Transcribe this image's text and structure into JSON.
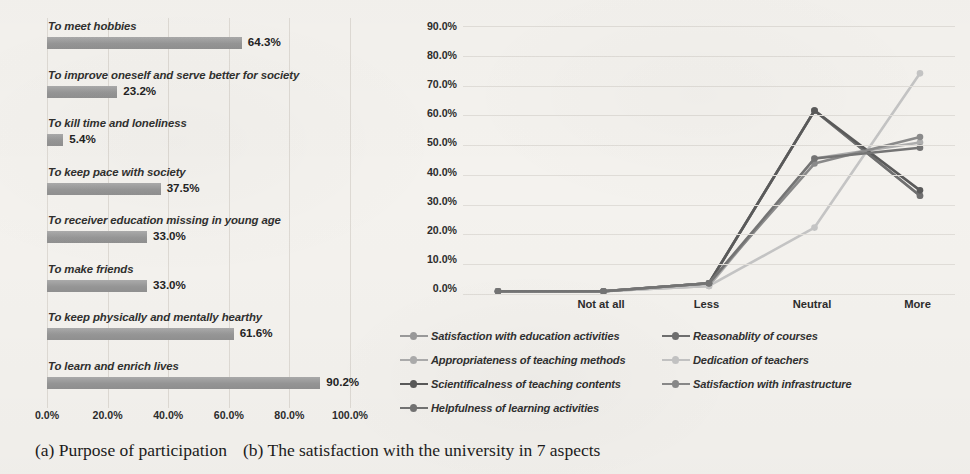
{
  "figure": {
    "captions": [
      {
        "tag": "(a)",
        "text": "Purpose of participation"
      },
      {
        "tag": "(b)",
        "text": "The satisfaction with the university in 7 aspects"
      }
    ]
  },
  "chart_data": [
    {
      "type": "bar",
      "orientation": "horizontal",
      "title": "",
      "xlabel": "",
      "ylabel": "",
      "xlim": [
        0,
        100
      ],
      "grid": true,
      "tick_labels": [
        "0.0%",
        "20.0%",
        "40.0%",
        "60.0%",
        "80.0%",
        "100.0%"
      ],
      "ticks": [
        0,
        20,
        40,
        60,
        80,
        100
      ],
      "bar_color": "#9a9a9a",
      "categories": [
        "To meet hobbies",
        "To improve oneself and serve better for society",
        "To kill time and loneliness",
        "To keep pace with  society",
        "To receiver education missing in young age",
        "To make friends",
        "To keep physically and mentally hearthy",
        "To learn and enrich lives"
      ],
      "values": [
        64.3,
        23.2,
        5.4,
        37.5,
        33.0,
        33.0,
        61.6,
        90.2
      ],
      "value_labels": [
        "64.3%",
        "23.2%",
        "5.4%",
        "37.5%",
        "33.0%",
        "33.0%",
        "61.6%",
        "90.2%"
      ]
    },
    {
      "type": "line",
      "title": "",
      "xlabel": "",
      "ylabel": "",
      "ylim": [
        0,
        90
      ],
      "grid": true,
      "legend_position": "bottom",
      "categories": [
        "Not at all",
        "Less",
        "Neutral",
        "More",
        "Very"
      ],
      "y_tick_labels": [
        "0.0%",
        "10.0%",
        "20.0%",
        "30.0%",
        "40.0%",
        "50.0%",
        "60.0%",
        "70.0%",
        "80.0%",
        "90.0%"
      ],
      "y_ticks": [
        0,
        10,
        20,
        30,
        40,
        50,
        60,
        70,
        80,
        90
      ],
      "series": [
        {
          "name": "Satisfaction with education activities",
          "color": "#9b9b9b",
          "values": [
            0.9,
            0.9,
            3.6,
            61.6,
            33.0
          ]
        },
        {
          "name": "Reasonablity of courses",
          "color": "#6f6f6f",
          "values": [
            0.9,
            0.9,
            3.6,
            61.6,
            33.0
          ]
        },
        {
          "name": "Appropriateness of teaching methods",
          "color": "#adadad",
          "values": [
            0.9,
            0.9,
            2.7,
            45.5,
            50.9
          ]
        },
        {
          "name": "Dedication of teachers",
          "color": "#c4c4c4",
          "values": [
            0.9,
            0.9,
            2.7,
            22.3,
            74.1
          ]
        },
        {
          "name": "Scientificalness of teaching contents",
          "color": "#5a5a5a",
          "values": [
            0.9,
            0.9,
            3.6,
            61.6,
            34.8
          ]
        },
        {
          "name": "Satisfaction with infrastructure",
          "color": "#8a8a8a",
          "values": [
            0.9,
            0.9,
            3.6,
            43.8,
            52.7
          ]
        },
        {
          "name": "Helpfulness of learning activities",
          "color": "#747474",
          "values": [
            0.9,
            0.9,
            3.6,
            45.5,
            49.1
          ]
        }
      ]
    }
  ]
}
